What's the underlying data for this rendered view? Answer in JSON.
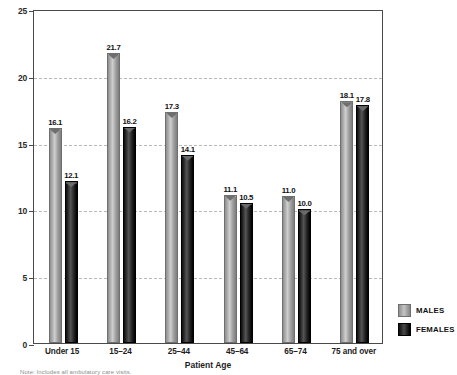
{
  "chart_data": {
    "type": "bar",
    "title": "",
    "xlabel": "Patient Age",
    "ylabel": "Rate per 100 Population",
    "categories": [
      "Under 15",
      "15–24",
      "25–44",
      "45–64",
      "65–74",
      "75 and over"
    ],
    "series": [
      {
        "name": "MALES",
        "color": "#a0a0a0",
        "values": [
          16.1,
          21.7,
          17.3,
          11.1,
          11.0,
          18.1
        ],
        "value_labels": [
          "16.1",
          "21.7",
          "17.3",
          "11.1",
          "11.0",
          "18.1"
        ]
      },
      {
        "name": "FEMALES",
        "color": "#000000",
        "values": [
          12.1,
          16.2,
          14.1,
          10.5,
          10.0,
          17.8
        ],
        "value_labels": [
          "12.1",
          "16.2",
          "14.1",
          "10.5",
          "10.0",
          "17.8"
        ]
      }
    ],
    "ylim": [
      0,
      25
    ],
    "yticks": [
      0,
      5,
      10,
      15,
      20,
      25
    ],
    "ytick_labels": [
      "0",
      "5",
      "10",
      "15",
      "20",
      "25"
    ],
    "gridlines_at": [
      5,
      10,
      15,
      20
    ],
    "grid": true,
    "legend_position": "bottom-right"
  },
  "legend": {
    "entries": [
      {
        "label": "MALES",
        "swatch": "males"
      },
      {
        "label": "FEMALES",
        "swatch": "females"
      }
    ]
  },
  "footnote": {
    "text": "Note: Includes all ambulatory care visits."
  }
}
